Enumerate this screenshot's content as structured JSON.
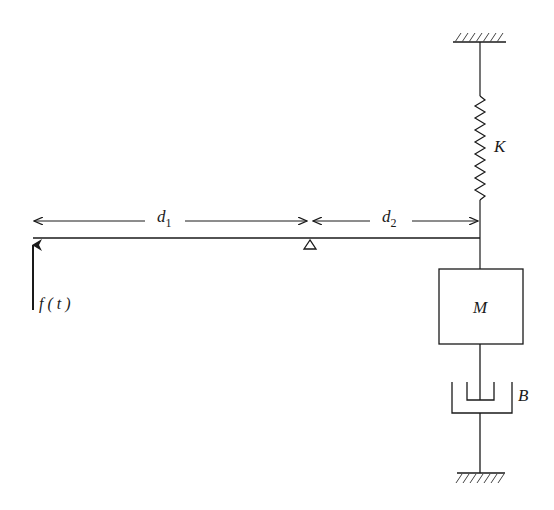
{
  "diagram": {
    "type": "mechanical lever-spring-mass-damper system",
    "colors": {
      "stroke": "#1a1a1a",
      "background": "#ffffff"
    },
    "labels": {
      "d1": {
        "main": "d",
        "sub": "1"
      },
      "d2": {
        "main": "d",
        "sub": "2"
      },
      "spring": "K",
      "mass": "M",
      "damper": "B",
      "force": "f ( t )"
    },
    "components": [
      {
        "name": "lever-beam",
        "description": "horizontal lever"
      },
      {
        "name": "pivot",
        "description": "triangular fulcrum under beam"
      },
      {
        "name": "force-arrow",
        "description": "upward applied force at left end"
      },
      {
        "name": "spring",
        "label": "K"
      },
      {
        "name": "mass",
        "label": "M"
      },
      {
        "name": "damper",
        "label": "B"
      },
      {
        "name": "ground-top"
      },
      {
        "name": "ground-bottom"
      }
    ]
  }
}
